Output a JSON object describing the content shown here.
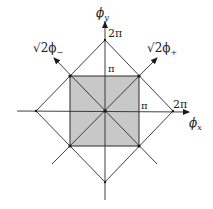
{
  "diagram": {
    "type": "phase-space-diagram",
    "axes": {
      "x_label": "ϕ",
      "x_sub": "x",
      "y_label": "ϕ",
      "y_sub": "y",
      "diag_plus_prefix": "√2ϕ",
      "diag_plus_sub": "+",
      "diag_minus_prefix": "√2ϕ",
      "diag_minus_sub": "−"
    },
    "ticks": {
      "x_pi": "π",
      "x_2pi": "2π",
      "y_pi": "π",
      "y_2pi": "2π"
    },
    "colors": {
      "line": "#2a2a2a",
      "shaded_square": "#c8c8c8",
      "background": "#ffffff"
    }
  }
}
